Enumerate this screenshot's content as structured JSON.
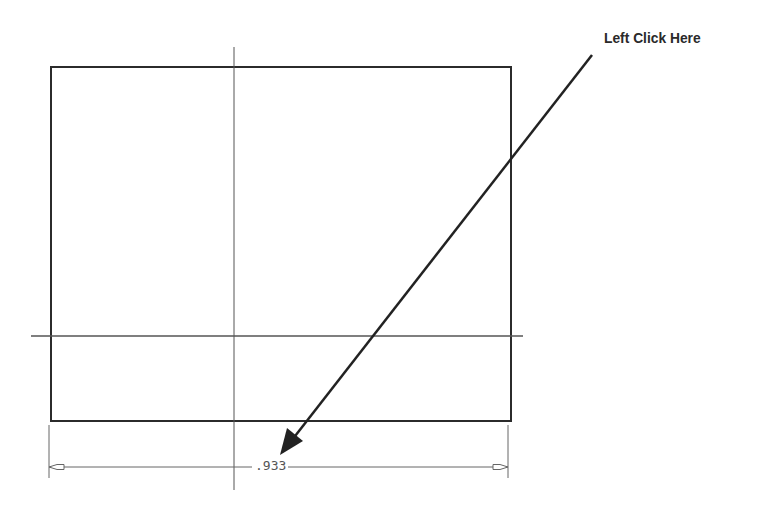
{
  "callout": {
    "label": "Left Click Here"
  },
  "dimension": {
    "value": ".933"
  },
  "colors": {
    "outline": "#2b2b2b",
    "centerline": "#555555",
    "dimension": "#666666",
    "arrow": "#222222"
  }
}
